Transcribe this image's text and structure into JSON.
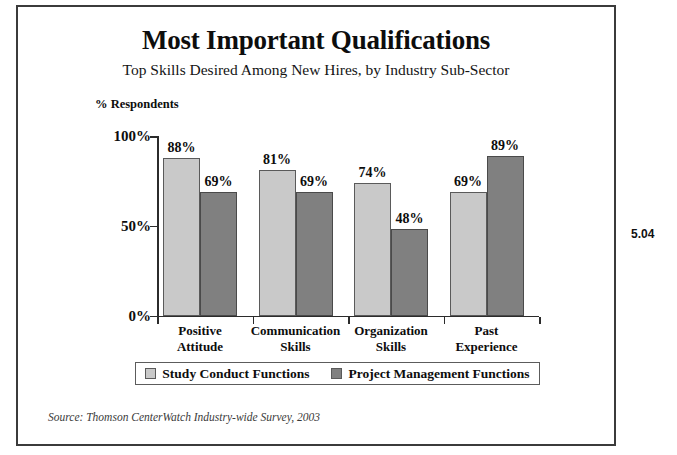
{
  "figure": {
    "number": "5.04",
    "source_note": "Source: Thomson CenterWatch Industry-wide Survey, 2003"
  },
  "chart_data": {
    "type": "bar",
    "title": "Most Important Qualifications",
    "subtitle": "Top Skills Desired Among New Hires, by Industry Sub-Sector",
    "xlabel": "",
    "ylabel": "% Respondents",
    "ylim": [
      0,
      100
    ],
    "yticks": [
      "0%",
      "50%",
      "100%"
    ],
    "ytick_values": [
      0,
      50,
      100
    ],
    "grid": false,
    "legend_position": "bottom",
    "categories": [
      "Positive\nAttitude",
      "Communication\nSkills",
      "Organization\nSkills",
      "Past\nExperience"
    ],
    "category_lines": [
      [
        "Positive",
        "Attitude"
      ],
      [
        "Communication",
        "Skills"
      ],
      [
        "Organization",
        "Skills"
      ],
      [
        "Past",
        "Experience"
      ]
    ],
    "series": [
      {
        "name": "Study Conduct Functions",
        "color": "#c9c9c9",
        "values": [
          88,
          81,
          74,
          69
        ],
        "labels": [
          "88%",
          "81%",
          "74%",
          "69%"
        ]
      },
      {
        "name": "Project Management Functions",
        "color": "#808080",
        "values": [
          69,
          69,
          48,
          89
        ],
        "labels": [
          "69%",
          "69%",
          "48%",
          "89%"
        ]
      }
    ]
  }
}
